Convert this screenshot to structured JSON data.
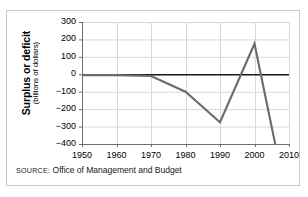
{
  "figure": {
    "source_label": "SOURCE:",
    "source_text": "Office of Management and Budget",
    "frame_color": "#c9c9c9",
    "background": "#ffffff"
  },
  "chart_data": {
    "type": "line",
    "title": "",
    "subtitle": "",
    "xlabel": "",
    "ylabel": "Surplus or deficit",
    "ylabel_line1": "Surplus or deficit",
    "ylabel_line2": "(billions of dollars)",
    "yunits": "billions of dollars",
    "xlim": [
      1950,
      2010
    ],
    "ylim": [
      -400,
      300
    ],
    "ytick_step": 100,
    "xtick_step": 10,
    "grid": true,
    "grid_color": "#d8d8d8",
    "zero_line": true,
    "zero_line_color": "#1a1a1a",
    "legend": "none",
    "series_color": "#6b6b6b",
    "xticks": [
      1950,
      1960,
      1970,
      1980,
      1990,
      2000,
      2010
    ],
    "xtick_labels": [
      "1950",
      "1960",
      "1970",
      "1980",
      "1990",
      "2000",
      "2010"
    ],
    "yticks": [
      300,
      200,
      100,
      0,
      -100,
      -200,
      -300,
      -400
    ],
    "ytick_labels": [
      "300",
      "200",
      "100",
      "0",
      "−100",
      "−200",
      "−300",
      "−400"
    ],
    "series": [
      {
        "name": "Federal surplus or deficit",
        "x": [
          1950,
          1960,
          1970,
          1980,
          1990,
          2000,
          2006
        ],
        "values": [
          -5,
          -5,
          -10,
          -100,
          -275,
          175,
          -400
        ]
      }
    ]
  }
}
